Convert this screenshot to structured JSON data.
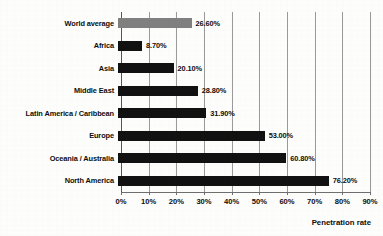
{
  "chart_data": {
    "type": "bar",
    "orientation": "horizontal",
    "title": "",
    "xlabel": "Penetration rate",
    "ylabel": "",
    "xlim": [
      0,
      90
    ],
    "grid": true,
    "legend": "none",
    "categories": [
      "World average",
      "Africa",
      "Asia",
      "Middle East",
      "Latin America / Caribbean",
      "Europe",
      "Oceania / Australia",
      "North America"
    ],
    "values": [
      26.6,
      8.7,
      20.1,
      28.8,
      31.9,
      53.0,
      60.8,
      76.2
    ],
    "value_labels": [
      "26.60%",
      "8.70%",
      "20.10%",
      "28.80%",
      "31.90%",
      "53.00%",
      "60.80%",
      "76.20%"
    ],
    "bar_colors": [
      "#808080",
      "#111111",
      "#111111",
      "#111111",
      "#111111",
      "#111111",
      "#111111",
      "#111111"
    ],
    "xticks": [
      0,
      10,
      20,
      30,
      40,
      50,
      60,
      70,
      80,
      90
    ],
    "xtick_labels": [
      "0%",
      "10%",
      "20%",
      "30%",
      "40%",
      "50%",
      "60%",
      "70%",
      "80%",
      "90%"
    ]
  }
}
